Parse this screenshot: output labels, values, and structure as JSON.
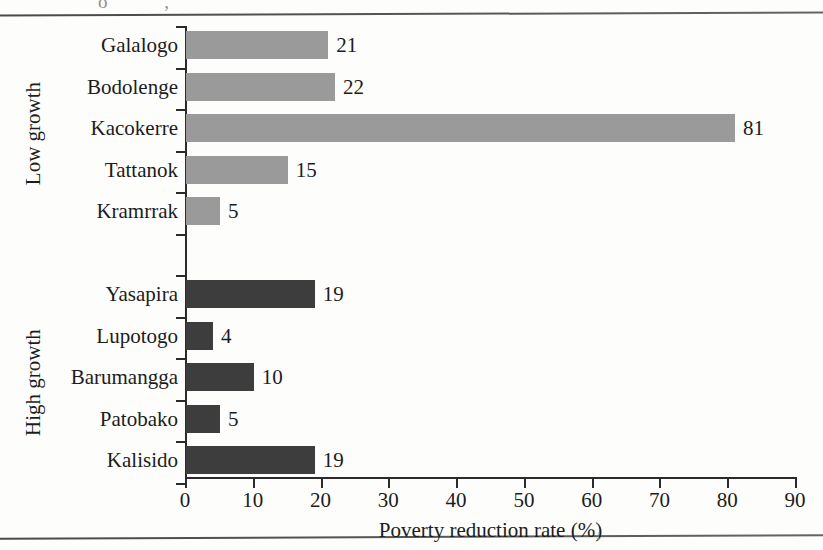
{
  "page": {
    "top_rule": true,
    "bottom_rule": true,
    "scan_artifact_top": "o        ,",
    "scan_artifact_axis": "↓"
  },
  "chart_data": {
    "type": "bar",
    "orientation": "horizontal",
    "title": "",
    "xlabel": "Poverty reduction rate (%)",
    "ylabel": "",
    "xlim": [
      0,
      90
    ],
    "xticks": [
      0,
      10,
      20,
      30,
      40,
      50,
      60,
      70,
      80,
      90
    ],
    "xtick_labels": [
      "0",
      "10",
      "20",
      "30",
      "40",
      "50",
      "60",
      "70",
      "80",
      "90"
    ],
    "grid": false,
    "legend": "none",
    "value_labels": true,
    "groups": [
      {
        "name": "Low growth",
        "color": "#9a9a9a",
        "categories": [
          "Galalogo",
          "Bodolenge",
          "Kacokerre",
          "Tattanok",
          "Kramrrak"
        ],
        "values": [
          21,
          22,
          81,
          15,
          5
        ]
      },
      {
        "name": "High growth",
        "color": "#3d3d3d",
        "categories": [
          "Yasapira",
          "Lupotogo",
          "Barumangga",
          "Patobako",
          "Kalisido"
        ],
        "values": [
          19,
          4,
          10,
          5,
          19
        ]
      }
    ],
    "categories": [
      "Galalogo",
      "Bodolenge",
      "Kacokerre",
      "Tattanok",
      "Kramrrak",
      "Yasapira",
      "Lupotogo",
      "Barumangga",
      "Patobako",
      "Kalisido"
    ],
    "values": [
      21,
      22,
      81,
      15,
      5,
      19,
      4,
      10,
      5,
      19
    ]
  },
  "colors": {
    "low_growth_bar": "#9a9a9a",
    "high_growth_bar": "#3d3d3d",
    "axis": "#2b2b2b",
    "text": "#1c1c1c",
    "background": "#fdfdfb"
  }
}
